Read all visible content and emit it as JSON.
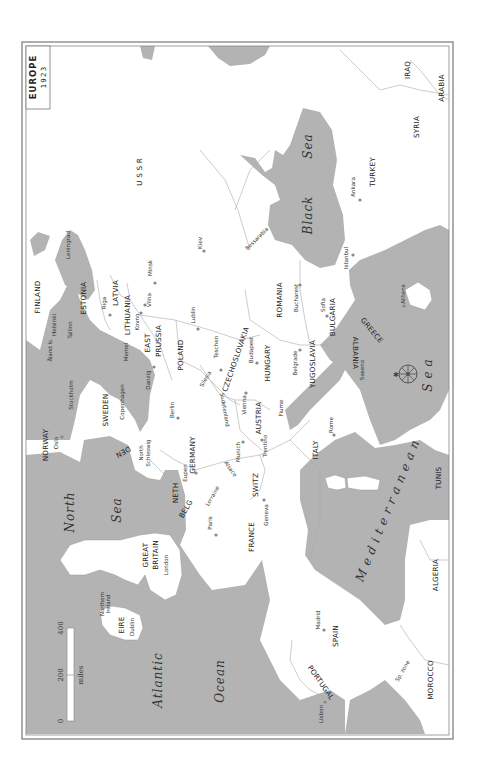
{
  "title": {
    "main": "EUROPE",
    "year": "1923"
  },
  "orientation": "rotated 90 degrees; north points left",
  "scale": {
    "ticks": [
      "0",
      "200",
      "400"
    ],
    "unit": "miles"
  },
  "seas": {
    "north_sea": [
      "North",
      "Sea"
    ],
    "atlantic": [
      "Atlantic",
      "Ocean"
    ],
    "black_sea": [
      "Black",
      "Sea"
    ],
    "mediterranean": [
      "Mediterranean",
      "Sea"
    ]
  },
  "countries": {
    "norway": "NORWAY",
    "sweden": "SWEDEN",
    "finland": "FINLAND",
    "estonia": "ESTONIA",
    "latvia": "LATVIA",
    "lithuania": "LITHUANIA",
    "east_prussia_1": "EAST",
    "east_prussia_2": "PRUSSIA",
    "ussr": "U S S R",
    "poland": "POLAND",
    "germany": "GERMANY",
    "den": "DEN",
    "neth": "NETH",
    "belg": "BELG",
    "great_britain_1": "GREAT",
    "great_britain_2": "BRITAIN",
    "eire": "EIRE",
    "france": "FRANCE",
    "switz": "SWITZ",
    "austria": "AUSTRIA",
    "czechoslovakia": "CZECHOSLOVAKIA",
    "hungary": "HUNGARY",
    "romania": "ROMANIA",
    "yugoslavia": "YUGOSLAVIA",
    "bulgaria": "BULGARIA",
    "albania": "ALBANIA",
    "greece": "GREECE",
    "italy": "ITALY",
    "spain": "SPAIN",
    "portugal": "PORTUGAL",
    "turkey": "TURKEY",
    "syria": "SYRIA",
    "iraq": "IRAQ",
    "arabia": "ARABIA",
    "tunis": "TUNIS",
    "algeria": "ALGERIA",
    "morocco": "MOROCCO"
  },
  "cities": {
    "oslo": "Oslo",
    "stockholm": "Stockholm",
    "helsinki": "Helsinki",
    "tallinn": "Tallinn",
    "leningrad": "Leningrad",
    "riga": "Riga",
    "kovno": "Kovno",
    "vilna": "Vilna",
    "minsk": "Minsk",
    "kiev": "Kiev",
    "memel": "Memel",
    "danzig": "Danzig",
    "copenhagen": "Copenhagen",
    "berlin": "Berlin",
    "lublin": "Lublin",
    "teschen": "Teschen",
    "vienna": "Vienna",
    "budapest": "Budapest",
    "bucharest": "Bucharest",
    "sofia": "Sofia",
    "istanbul": "Istanbul",
    "ankara": "Ankara",
    "athens": "Athens",
    "belgrade": "Belgrade",
    "fiume": "Fiume",
    "rome": "Rome",
    "munich": "Munich",
    "trentino": "Trentino",
    "geneva": "Geneva",
    "paris": "Paris",
    "eupen": "Eupen",
    "london": "London",
    "dublin": "Dublin",
    "madrid": "Madrid",
    "lisbon": "Lisbon",
    "saseno": "Saseno"
  },
  "regions": {
    "aland": "Åland Is.",
    "north_schleswig_1": "North",
    "north_schleswig_2": "Schleswig",
    "silesia": "Silesia",
    "sudetenland": "Sudetenland",
    "bessarabia": "Bessarabia",
    "alsace": "Alsace",
    "lorraine": "Lorraine",
    "northern_ireland_1": "Northern",
    "northern_ireland_2": "Ireland",
    "dodecanese": "Dodecanese",
    "sp_zone": "Sp. zone"
  }
}
